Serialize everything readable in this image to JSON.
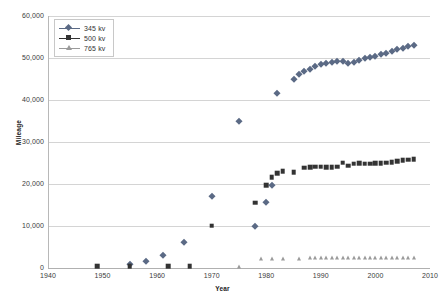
{
  "chart_data": {
    "type": "scatter",
    "title": "",
    "xlabel": "Year",
    "ylabel": "Mileage",
    "xlim": [
      1940,
      2010
    ],
    "ylim": [
      0,
      60000
    ],
    "grid": true,
    "legend_position": "top-left",
    "x_ticks": [
      1940,
      1950,
      1960,
      1970,
      1980,
      1990,
      2000,
      2010
    ],
    "x_tick_labels": [
      "1940",
      "1950",
      "1960",
      "1970",
      "1980",
      "1990",
      "2000",
      "2010"
    ],
    "y_ticks": [
      0,
      10000,
      20000,
      30000,
      40000,
      50000,
      60000
    ],
    "y_tick_labels": [
      "0",
      "10,000",
      "20,000",
      "30,000",
      "40,000",
      "50,000",
      "60,000"
    ],
    "series": [
      {
        "name": "345 kv",
        "color": "#5b6a85",
        "marker": "diamond",
        "points": [
          [
            1955,
            900
          ],
          [
            1958,
            1700
          ],
          [
            1961,
            3000
          ],
          [
            1965,
            6300
          ],
          [
            1970,
            17100
          ],
          [
            1975,
            34900
          ],
          [
            1978,
            10100
          ],
          [
            1980,
            15600
          ],
          [
            1981,
            19700
          ],
          [
            1982,
            41600
          ],
          [
            1985,
            44900
          ],
          [
            1986,
            46200
          ],
          [
            1987,
            46900
          ],
          [
            1988,
            47500
          ],
          [
            1989,
            48200
          ],
          [
            1990,
            48500
          ],
          [
            1991,
            48800
          ],
          [
            1992,
            49100
          ],
          [
            1993,
            49400
          ],
          [
            1994,
            49300
          ],
          [
            1995,
            48800
          ],
          [
            1996,
            49100
          ],
          [
            1997,
            49500
          ],
          [
            1998,
            49900
          ],
          [
            1999,
            50200
          ],
          [
            2000,
            50500
          ],
          [
            2001,
            50900
          ],
          [
            2002,
            51300
          ],
          [
            2003,
            51700
          ],
          [
            2004,
            52100
          ],
          [
            2005,
            52500
          ],
          [
            2006,
            52800
          ],
          [
            2007,
            53000
          ]
        ]
      },
      {
        "name": "500 kv",
        "color": "#333333",
        "marker": "square",
        "points": [
          [
            1949,
            400
          ],
          [
            1955,
            400
          ],
          [
            1962,
            400
          ],
          [
            1966,
            400
          ],
          [
            1970,
            10100
          ],
          [
            1978,
            15500
          ],
          [
            1980,
            19700
          ],
          [
            1981,
            21600
          ],
          [
            1982,
            22600
          ],
          [
            1983,
            23000
          ],
          [
            1985,
            22800
          ],
          [
            1987,
            23900
          ],
          [
            1988,
            24000
          ],
          [
            1989,
            24100
          ],
          [
            1990,
            24100
          ],
          [
            1991,
            24000
          ],
          [
            1992,
            24000
          ],
          [
            1993,
            24100
          ],
          [
            1994,
            25100
          ],
          [
            1995,
            24400
          ],
          [
            1996,
            24800
          ],
          [
            1997,
            24900
          ],
          [
            1998,
            24800
          ],
          [
            1999,
            24800
          ],
          [
            2000,
            24900
          ],
          [
            2001,
            25000
          ],
          [
            2002,
            25100
          ],
          [
            2003,
            25200
          ],
          [
            2004,
            25400
          ],
          [
            2005,
            25600
          ],
          [
            2006,
            25800
          ],
          [
            2007,
            25900
          ]
        ]
      },
      {
        "name": "765 kv",
        "color": "#9a9a9a",
        "marker": "triangle",
        "points": [
          [
            1975,
            300
          ],
          [
            1979,
            2100
          ],
          [
            1981,
            2050
          ],
          [
            1983,
            2150
          ],
          [
            1986,
            2250
          ],
          [
            1988,
            2300
          ],
          [
            1989,
            2300
          ],
          [
            1990,
            2300
          ],
          [
            1991,
            2300
          ],
          [
            1992,
            2300
          ],
          [
            1993,
            2300
          ],
          [
            1994,
            2300
          ],
          [
            1995,
            2300
          ],
          [
            1996,
            2300
          ],
          [
            1997,
            2300
          ],
          [
            1998,
            2300
          ],
          [
            1999,
            2300
          ],
          [
            2000,
            2300
          ],
          [
            2001,
            2300
          ],
          [
            2002,
            2300
          ],
          [
            2003,
            2300
          ],
          [
            2004,
            2300
          ],
          [
            2005,
            2300
          ],
          [
            2006,
            2300
          ],
          [
            2007,
            2300
          ]
        ]
      }
    ]
  }
}
